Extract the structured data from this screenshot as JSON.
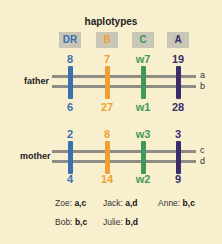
{
  "title": "haplotypes",
  "colors": {
    "DR": "#3a6fb0",
    "B": "#f0a032",
    "C": "#3f9a5a",
    "A": "#3b2d6b",
    "strand": "#8f8c86",
    "bg": "#f8efcf"
  },
  "loci": [
    {
      "name": "DR",
      "x": 70
    },
    {
      "name": "B",
      "x": 107
    },
    {
      "name": "C",
      "x": 143
    },
    {
      "name": "A",
      "x": 178
    }
  ],
  "father": {
    "label": "father",
    "strands": [
      "a",
      "b"
    ],
    "top": [
      "8",
      "7",
      "w7",
      "19"
    ],
    "bottom": [
      "6",
      "27",
      "w1",
      "28"
    ]
  },
  "mother": {
    "label": "mother",
    "strands": [
      "c",
      "d"
    ],
    "top": [
      "2",
      "8",
      "w3",
      "3"
    ],
    "bottom": [
      "4",
      "14",
      "w2",
      "9"
    ]
  },
  "children": [
    {
      "name": "Zoe:",
      "alleles": "a,c"
    },
    {
      "name": "Jack:",
      "alleles": "a,d"
    },
    {
      "name": "Anne:",
      "alleles": "b,c"
    },
    {
      "name": "Bob:",
      "alleles": "b,c"
    },
    {
      "name": "Julie:",
      "alleles": "b,d"
    }
  ]
}
